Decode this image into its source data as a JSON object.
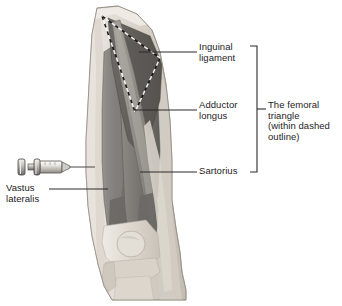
{
  "figure": {
    "view": "anterior view of right thigh, knee at bottom"
  },
  "labels": {
    "inguinal_ligament": "Inguinal\nligament",
    "adductor_longus": "Adductor\nlongus",
    "sartorius": "Sartorius",
    "femoral_triangle": "The femoral\ntriangle\n(within dashed\noutline)",
    "vastus_lateralis": "Vastus\nlateralis"
  },
  "icons": {
    "syringe": "syringe-icon",
    "bracket": "curly-bracket-icon",
    "dashed_triangle": "dashed-triangle-outline"
  },
  "colors": {
    "line": "#2b2b2b",
    "text": "#1d1d1d",
    "skin_light": "#e2ddd6",
    "skin_mid": "#cfc8bf",
    "muscle_dark": "#6f6f6f",
    "muscle_mid": "#8d8d8d",
    "muscle_light": "#a9a7a3",
    "bone": "#ded9d2",
    "background": "#ffffff"
  }
}
